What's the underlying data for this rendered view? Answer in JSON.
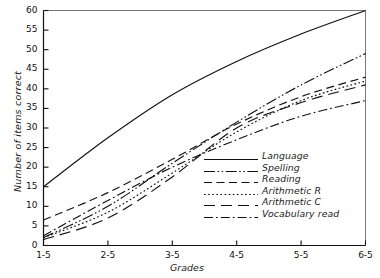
{
  "chart_data": {
    "type": "line",
    "title": "",
    "xlabel": "Grades",
    "ylabel": "Number of items correct",
    "x": [
      1.5,
      2.5,
      3.5,
      4.5,
      5.5,
      6.5
    ],
    "xtick_labels": [
      "1-5",
      "2-5",
      "3-5",
      "4-5",
      "5-5",
      "6-5"
    ],
    "ytick_labels": [
      "0",
      "5",
      "10",
      "15",
      "20",
      "25",
      "30",
      "35",
      "40",
      "45",
      "50",
      "55",
      "60"
    ],
    "ytick_values": [
      0,
      5,
      10,
      15,
      20,
      25,
      30,
      35,
      40,
      45,
      50,
      55,
      60
    ],
    "xlim": [
      1.5,
      6.5
    ],
    "ylim": [
      0,
      60
    ],
    "grid": false,
    "legend_position": "lower right",
    "series": [
      {
        "name": "Language",
        "dash": "solid",
        "values": [
          15.0,
          27.5,
          38.5,
          47.0,
          54.0,
          60.0
        ]
      },
      {
        "name": "Spelling",
        "dash": "dash-dot-dot",
        "values": [
          2.0,
          10.0,
          21.0,
          31.5,
          41.0,
          49.0
        ]
      },
      {
        "name": "Reading",
        "dash": "dash",
        "values": [
          6.5,
          13.5,
          22.0,
          31.0,
          38.0,
          43.0
        ]
      },
      {
        "name": "Arithmetic R",
        "dash": "dot",
        "values": [
          2.0,
          8.5,
          18.5,
          29.0,
          37.0,
          42.0
        ]
      },
      {
        "name": "Arithmetic C",
        "dash": "long-dash",
        "values": [
          1.5,
          7.0,
          17.5,
          30.0,
          36.5,
          41.0
        ]
      },
      {
        "name": "Vocabulary read",
        "dash": "dash-dot",
        "values": [
          2.5,
          11.5,
          20.0,
          27.0,
          33.0,
          37.0
        ]
      }
    ]
  },
  "axes": {
    "x_label": "Grades",
    "y_label": "Number of items correct"
  }
}
